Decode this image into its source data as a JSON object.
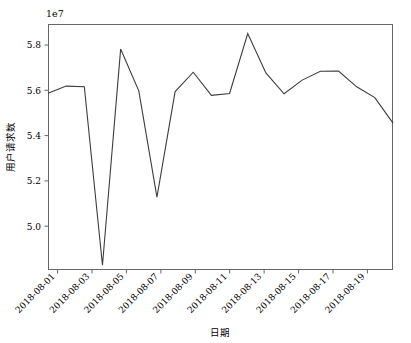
{
  "chart_data": {
    "type": "line",
    "title": "",
    "xlabel": "日期",
    "ylabel": "用户请求数",
    "y_exponent_label": "1e7",
    "y_scale": 10000000,
    "grid": false,
    "legend": null,
    "line_color": "#3c3c3c",
    "axis_color": "#666666",
    "xlim": [
      "2018-08-01",
      "2018-08-20"
    ],
    "ylim": [
      48500000,
      58800000
    ],
    "ytick_values": [
      5.0,
      5.2,
      5.4,
      5.6,
      5.8
    ],
    "ytick_labels": [
      "5.0",
      "5.2",
      "5.4",
      "5.6",
      "5.8"
    ],
    "xtick_labels": [
      "2018-08-01",
      "2018-08-03",
      "2018-08-05",
      "2018-08-07",
      "2018-08-09",
      "2018-08-11",
      "2018-08-13",
      "2018-08-15",
      "2018-08-17",
      "2018-08-19"
    ],
    "xtick_rotation_deg": 45,
    "x": [
      "2018-08-01",
      "2018-08-02",
      "2018-08-03",
      "2018-08-04",
      "2018-08-05",
      "2018-08-06",
      "2018-08-07",
      "2018-08-08",
      "2018-08-09",
      "2018-08-10",
      "2018-08-11",
      "2018-08-12",
      "2018-08-13",
      "2018-08-14",
      "2018-08-15",
      "2018-08-16",
      "2018-08-17",
      "2018-08-18",
      "2018-08-19",
      "2018-08-20"
    ],
    "values": [
      55900000,
      56200000,
      56170000,
      48700000,
      57750000,
      56000000,
      51550000,
      55970000,
      56780000,
      55810000,
      55890000,
      58400000,
      56750000,
      55880000,
      56450000,
      56820000,
      56830000,
      56170000,
      55720000,
      54650000
    ],
    "series_name": "用户请求数"
  }
}
